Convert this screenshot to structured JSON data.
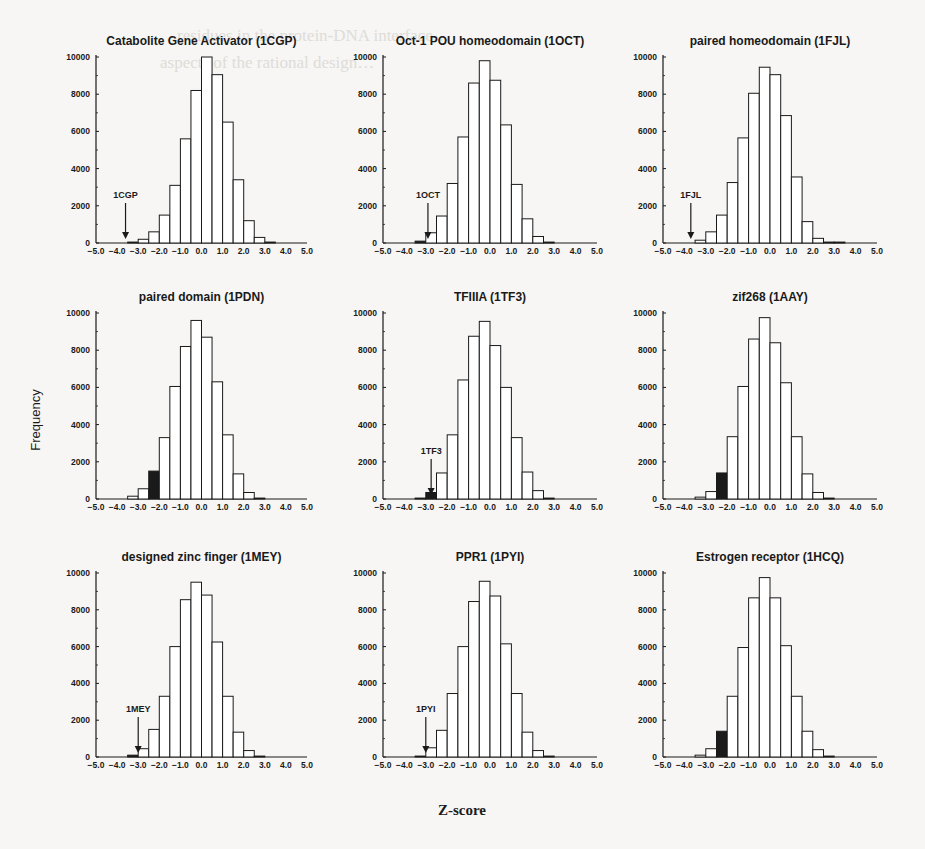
{
  "figure": {
    "ylabel": "Frequency",
    "xlabel": "Z-score",
    "background_text": [
      "…residues in the protein-DNA interface…",
      "aspects of the rational design…"
    ]
  },
  "chart_data": {
    "type": "bar",
    "layout": "3x3 grid of histograms",
    "shared_xlabel": "Z-score",
    "shared_ylabel": "Frequency",
    "x_ticks": [
      "-5.0",
      "-4.0",
      "-3.0",
      "-2.0",
      "-1.0",
      "0.0",
      "1.0",
      "2.0",
      "3.0",
      "4.0",
      "5.0"
    ],
    "y_ticks": [
      "0",
      "2000",
      "4000",
      "6000",
      "8000",
      "10000"
    ],
    "xlim": [
      -5.0,
      5.0
    ],
    "ylim": [
      0,
      10000
    ],
    "bin_width": 0.5,
    "bin_edges": [
      -3.5,
      -3.0,
      -2.5,
      -2.0,
      -1.5,
      -1.0,
      -0.5,
      0.0,
      0.5,
      1.0,
      1.5,
      2.0,
      2.5,
      3.0,
      3.5
    ],
    "grid": false,
    "legend": "none",
    "panels": [
      {
        "title": "Catabolite Gene Activator (1CGP)",
        "marker_label": "1CGP",
        "marker_z": -3.6,
        "marker_style": "arrow",
        "highlight_bin": null,
        "values": [
          50,
          200,
          600,
          1500,
          3100,
          5600,
          8200,
          10000,
          9050,
          6500,
          3400,
          1200,
          300,
          50
        ]
      },
      {
        "title": "Oct-1 POU homeodomain (1OCT)",
        "marker_label": "1OCT",
        "marker_z": -2.9,
        "marker_style": "arrow",
        "highlight_bin": 0,
        "values": [
          100,
          550,
          1450,
          3200,
          5700,
          8600,
          9800,
          8750,
          6350,
          3150,
          1300,
          350,
          50,
          0
        ]
      },
      {
        "title": "paired homeodomain (1FJL)",
        "marker_label": "1FJL",
        "marker_z": -3.7,
        "marker_style": "arrow",
        "highlight_bin": null,
        "values": [
          150,
          600,
          1500,
          3250,
          5650,
          8050,
          9450,
          9050,
          6850,
          3550,
          1150,
          250,
          50,
          50
        ]
      },
      {
        "title": "paired domain (1PDN)",
        "marker_label": "",
        "marker_z": -2.25,
        "marker_style": "filled-bar",
        "highlight_bin": 2,
        "values": [
          150,
          550,
          1500,
          3300,
          6050,
          8200,
          9600,
          8700,
          6300,
          3450,
          1350,
          350,
          50,
          0
        ]
      },
      {
        "title": "TFIIIA (1TF3)",
        "marker_label": "1TF3",
        "marker_z": -2.75,
        "marker_style": "arrow+filled-bar",
        "highlight_bin": 1,
        "values": [
          50,
          350,
          1400,
          3450,
          6400,
          8750,
          9550,
          8250,
          6000,
          3300,
          1450,
          450,
          50,
          0
        ]
      },
      {
        "title": "zif268 (1AAY)",
        "marker_label": "",
        "marker_z": -2.25,
        "marker_style": "filled-bar",
        "highlight_bin": 2,
        "values": [
          100,
          400,
          1400,
          3350,
          6050,
          8600,
          9750,
          8400,
          6250,
          3350,
          1350,
          350,
          50,
          0
        ]
      },
      {
        "title": "designed zinc finger (1MEY)",
        "marker_label": "1MEY",
        "marker_z": -3.0,
        "marker_style": "arrow+filled-bar",
        "highlight_bin": 0,
        "values": [
          100,
          450,
          1500,
          3300,
          6000,
          8550,
          9500,
          8800,
          6250,
          3300,
          1350,
          350,
          50,
          0
        ]
      },
      {
        "title": "PPR1 (1PYI)",
        "marker_label": "1PYI",
        "marker_z": -3.0,
        "marker_style": "arrow",
        "highlight_bin": null,
        "values": [
          50,
          500,
          1450,
          3450,
          6000,
          8450,
          9550,
          8750,
          6150,
          3450,
          1350,
          350,
          50,
          0
        ]
      },
      {
        "title": "Estrogen receptor (1HCQ)",
        "marker_label": "",
        "marker_z": -2.25,
        "marker_style": "filled-bar",
        "highlight_bin": 2,
        "values": [
          100,
          450,
          1400,
          3300,
          5950,
          8650,
          9750,
          8650,
          6050,
          3300,
          1400,
          400,
          50,
          0
        ]
      }
    ]
  }
}
